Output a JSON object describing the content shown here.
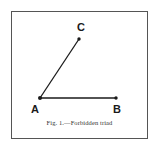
{
  "figure": {
    "caption": "Fig. 1.—Forbidden triad",
    "points": {
      "A": {
        "label": "A",
        "x": 40,
        "y": 98
      },
      "B": {
        "label": "B",
        "x": 116,
        "y": 98
      },
      "C": {
        "label": "C",
        "x": 79,
        "y": 39
      }
    },
    "edges": [
      {
        "from": "A",
        "to": "B"
      },
      {
        "from": "A",
        "to": "C"
      }
    ],
    "colors": {
      "ink": "#1a1a1a",
      "frame": "#555555",
      "background": "#ffffff"
    }
  }
}
